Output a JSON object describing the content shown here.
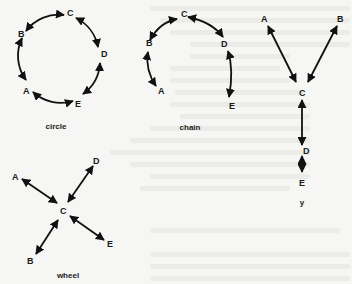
{
  "figure": {
    "colors": {
      "ink": "#111111",
      "background": "#f6f6f4",
      "faded_text": "#ebebe8"
    }
  },
  "networks": {
    "circle": {
      "caption": "circle",
      "nodes": {
        "A": "A",
        "B": "B",
        "C": "C",
        "D": "D",
        "E": "E"
      },
      "edges": [
        [
          "A",
          "B"
        ],
        [
          "B",
          "C"
        ],
        [
          "C",
          "D"
        ],
        [
          "D",
          "E"
        ],
        [
          "E",
          "A"
        ]
      ]
    },
    "chain": {
      "caption": "chain",
      "nodes": {
        "A": "A",
        "B": "B",
        "C": "C",
        "D": "D",
        "E": "E"
      },
      "edges": [
        [
          "A",
          "B"
        ],
        [
          "B",
          "C"
        ],
        [
          "C",
          "D"
        ],
        [
          "D",
          "E"
        ]
      ]
    },
    "y": {
      "caption": "y",
      "nodes": {
        "A": "A",
        "B": "B",
        "C": "C",
        "D": "D",
        "E": "E"
      },
      "edges": [
        [
          "A",
          "C"
        ],
        [
          "B",
          "C"
        ],
        [
          "C",
          "D"
        ],
        [
          "D",
          "E"
        ]
      ]
    },
    "wheel": {
      "caption": "wheel",
      "nodes": {
        "A": "A",
        "B": "B",
        "C": "C",
        "D": "D",
        "E": "E"
      },
      "edges": [
        [
          "A",
          "C"
        ],
        [
          "B",
          "C"
        ],
        [
          "D",
          "C"
        ],
        [
          "E",
          "C"
        ]
      ]
    }
  }
}
